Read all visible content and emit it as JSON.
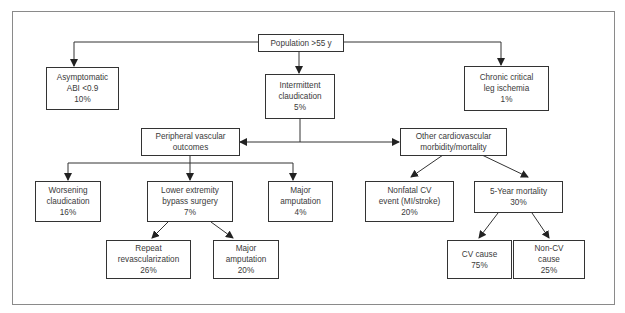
{
  "diagram": {
    "type": "flowchart",
    "nodes": {
      "population": {
        "lines": [
          "Population >55 y"
        ]
      },
      "asymptomatic": {
        "lines": [
          "Asymptomatic",
          "ABI <0.9",
          "10%"
        ]
      },
      "intermittent": {
        "lines": [
          "Intermittent",
          "claudication",
          "5%"
        ]
      },
      "chronic": {
        "lines": [
          "Chronic critical",
          "leg ischemia",
          "1%"
        ]
      },
      "peripheral": {
        "lines": [
          "Peripheral vascular",
          "outcomes"
        ]
      },
      "other_cv": {
        "lines": [
          "Other cardiovascular",
          "morbidity/mortality"
        ]
      },
      "worsening": {
        "lines": [
          "Worsening",
          "claudication",
          "16%"
        ]
      },
      "lower_ext": {
        "lines": [
          "Lower extremity",
          "bypass surgery",
          "7%"
        ]
      },
      "major_amp_1": {
        "lines": [
          "Major",
          "amputation",
          "4%"
        ]
      },
      "nonfatal": {
        "lines": [
          "Nonfatal CV",
          "event (MI/stroke)",
          "20%"
        ]
      },
      "five_year": {
        "lines": [
          "5-Year mortality",
          "30%"
        ]
      },
      "repeat": {
        "lines": [
          "Repeat",
          "revascularization",
          "26%"
        ]
      },
      "major_amp_2": {
        "lines": [
          "Major",
          "amputation",
          "20%"
        ]
      },
      "cv_cause": {
        "lines": [
          "CV cause",
          "75%"
        ]
      },
      "non_cv": {
        "lines": [
          "Non-CV",
          "cause",
          "25%"
        ]
      }
    },
    "edges": [
      [
        "population",
        "asymptomatic"
      ],
      [
        "population",
        "intermittent"
      ],
      [
        "population",
        "chronic"
      ],
      [
        "intermittent",
        "peripheral"
      ],
      [
        "intermittent",
        "other_cv"
      ],
      [
        "peripheral",
        "worsening"
      ],
      [
        "peripheral",
        "lower_ext"
      ],
      [
        "peripheral",
        "major_amp_1"
      ],
      [
        "lower_ext",
        "repeat"
      ],
      [
        "lower_ext",
        "major_amp_2"
      ],
      [
        "other_cv",
        "nonfatal"
      ],
      [
        "other_cv",
        "five_year"
      ],
      [
        "five_year",
        "cv_cause"
      ],
      [
        "five_year",
        "non_cv"
      ]
    ]
  }
}
